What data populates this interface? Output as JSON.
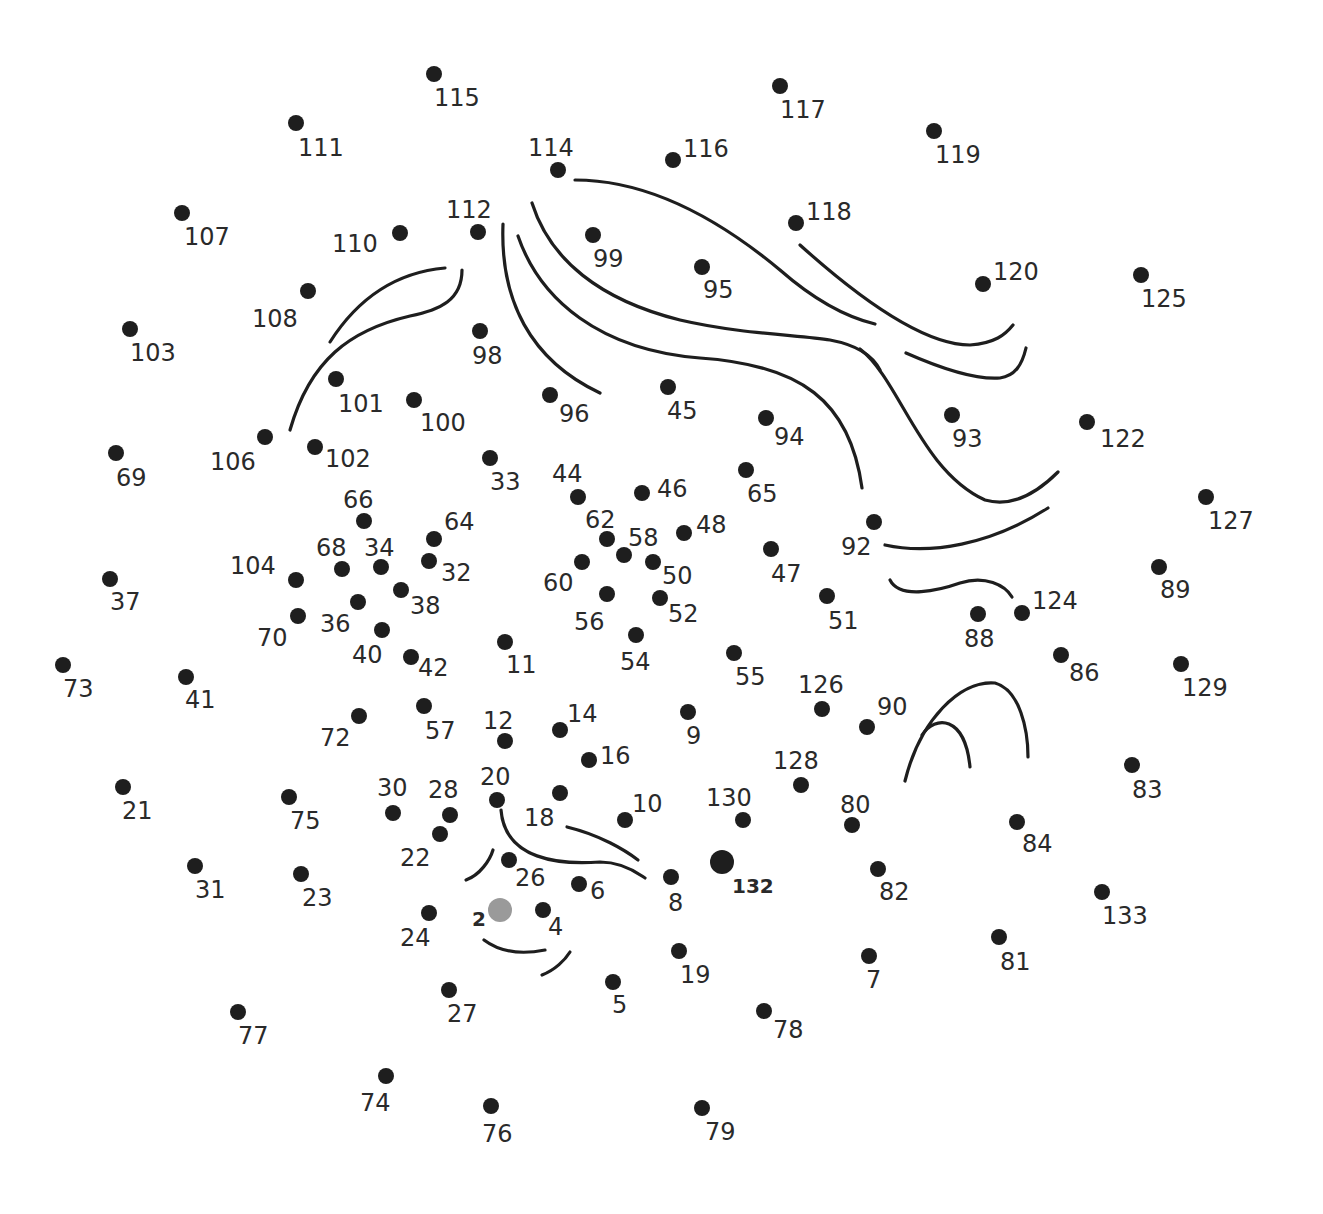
{
  "puzzle": {
    "title": "Dot-to-dot puzzle",
    "dot_color": "#1e1e1e",
    "start_dot_color": "#9a9a9a",
    "start": 2,
    "end": 132,
    "dots": [
      {
        "n": "2",
        "x": 500,
        "y": 910,
        "lx": 472,
        "ly": 926,
        "start": true,
        "bold": true
      },
      {
        "n": "4",
        "x": 543,
        "y": 910,
        "lx": 548,
        "ly": 935
      },
      {
        "n": "5",
        "x": 613,
        "y": 982,
        "lx": 612,
        "ly": 1013
      },
      {
        "n": "6",
        "x": 579,
        "y": 884,
        "lx": 590,
        "ly": 899
      },
      {
        "n": "7",
        "x": 869,
        "y": 956,
        "lx": 866,
        "ly": 988
      },
      {
        "n": "8",
        "x": 671,
        "y": 877,
        "lx": 668,
        "ly": 911
      },
      {
        "n": "9",
        "x": 688,
        "y": 712,
        "lx": 686,
        "ly": 744
      },
      {
        "n": "10",
        "x": 625,
        "y": 820,
        "lx": 632,
        "ly": 812
      },
      {
        "n": "11",
        "x": 505,
        "y": 642,
        "lx": 506,
        "ly": 673
      },
      {
        "n": "12",
        "x": 505,
        "y": 741,
        "lx": 483,
        "ly": 729
      },
      {
        "n": "14",
        "x": 560,
        "y": 730,
        "lx": 567,
        "ly": 722
      },
      {
        "n": "16",
        "x": 589,
        "y": 760,
        "lx": 600,
        "ly": 764
      },
      {
        "n": "18",
        "x": 560,
        "y": 793,
        "lx": 524,
        "ly": 826
      },
      {
        "n": "19",
        "x": 679,
        "y": 951,
        "lx": 680,
        "ly": 983
      },
      {
        "n": "20",
        "x": 497,
        "y": 800,
        "lx": 480,
        "ly": 785
      },
      {
        "n": "21",
        "x": 123,
        "y": 787,
        "lx": 122,
        "ly": 819
      },
      {
        "n": "22",
        "x": 440,
        "y": 834,
        "lx": 400,
        "ly": 866
      },
      {
        "n": "23",
        "x": 301,
        "y": 874,
        "lx": 302,
        "ly": 906
      },
      {
        "n": "24",
        "x": 429,
        "y": 913,
        "lx": 400,
        "ly": 946
      },
      {
        "n": "26",
        "x": 509,
        "y": 860,
        "lx": 515,
        "ly": 886
      },
      {
        "n": "27",
        "x": 449,
        "y": 990,
        "lx": 447,
        "ly": 1022
      },
      {
        "n": "28",
        "x": 450,
        "y": 815,
        "lx": 428,
        "ly": 798
      },
      {
        "n": "30",
        "x": 393,
        "y": 813,
        "lx": 377,
        "ly": 796
      },
      {
        "n": "31",
        "x": 195,
        "y": 866,
        "lx": 195,
        "ly": 898
      },
      {
        "n": "32",
        "x": 429,
        "y": 561,
        "lx": 441,
        "ly": 581
      },
      {
        "n": "33",
        "x": 490,
        "y": 458,
        "lx": 490,
        "ly": 490
      },
      {
        "n": "34",
        "x": 381,
        "y": 567,
        "lx": 364,
        "ly": 556
      },
      {
        "n": "36",
        "x": 358,
        "y": 602,
        "lx": 320,
        "ly": 632
      },
      {
        "n": "37",
        "x": 110,
        "y": 579,
        "lx": 110,
        "ly": 610
      },
      {
        "n": "38",
        "x": 401,
        "y": 590,
        "lx": 410,
        "ly": 614
      },
      {
        "n": "40",
        "x": 382,
        "y": 630,
        "lx": 352,
        "ly": 663
      },
      {
        "n": "41",
        "x": 186,
        "y": 677,
        "lx": 185,
        "ly": 708
      },
      {
        "n": "42",
        "x": 411,
        "y": 657,
        "lx": 418,
        "ly": 676
      },
      {
        "n": "44",
        "x": 578,
        "y": 497,
        "lx": 552,
        "ly": 482
      },
      {
        "n": "45",
        "x": 668,
        "y": 387,
        "lx": 667,
        "ly": 419
      },
      {
        "n": "46",
        "x": 642,
        "y": 493,
        "lx": 657,
        "ly": 497
      },
      {
        "n": "47",
        "x": 771,
        "y": 549,
        "lx": 771,
        "ly": 582
      },
      {
        "n": "48",
        "x": 684,
        "y": 533,
        "lx": 696,
        "ly": 533
      },
      {
        "n": "50",
        "x": 653,
        "y": 562,
        "lx": 662,
        "ly": 584
      },
      {
        "n": "51",
        "x": 827,
        "y": 596,
        "lx": 828,
        "ly": 629
      },
      {
        "n": "52",
        "x": 660,
        "y": 598,
        "lx": 668,
        "ly": 622
      },
      {
        "n": "54",
        "x": 636,
        "y": 635,
        "lx": 620,
        "ly": 670
      },
      {
        "n": "55",
        "x": 734,
        "y": 653,
        "lx": 735,
        "ly": 685
      },
      {
        "n": "56",
        "x": 607,
        "y": 594,
        "lx": 574,
        "ly": 630
      },
      {
        "n": "57",
        "x": 424,
        "y": 706,
        "lx": 425,
        "ly": 739
      },
      {
        "n": "58",
        "x": 624,
        "y": 555,
        "lx": 628,
        "ly": 546
      },
      {
        "n": "60",
        "x": 582,
        "y": 562,
        "lx": 543,
        "ly": 591
      },
      {
        "n": "62",
        "x": 607,
        "y": 539,
        "lx": 585,
        "ly": 528
      },
      {
        "n": "64",
        "x": 434,
        "y": 539,
        "lx": 444,
        "ly": 530
      },
      {
        "n": "65",
        "x": 746,
        "y": 470,
        "lx": 747,
        "ly": 502
      },
      {
        "n": "66",
        "x": 364,
        "y": 521,
        "lx": 343,
        "ly": 508
      },
      {
        "n": "68",
        "x": 342,
        "y": 569,
        "lx": 316,
        "ly": 556
      },
      {
        "n": "69",
        "x": 116,
        "y": 453,
        "lx": 116,
        "ly": 486
      },
      {
        "n": "70",
        "x": 298,
        "y": 616,
        "lx": 257,
        "ly": 646
      },
      {
        "n": "72",
        "x": 359,
        "y": 716,
        "lx": 320,
        "ly": 746
      },
      {
        "n": "73",
        "x": 63,
        "y": 665,
        "lx": 63,
        "ly": 697
      },
      {
        "n": "74",
        "x": 386,
        "y": 1076,
        "lx": 360,
        "ly": 1111
      },
      {
        "n": "75",
        "x": 289,
        "y": 797,
        "lx": 290,
        "ly": 829
      },
      {
        "n": "76",
        "x": 491,
        "y": 1106,
        "lx": 482,
        "ly": 1142
      },
      {
        "n": "77",
        "x": 238,
        "y": 1012,
        "lx": 238,
        "ly": 1044
      },
      {
        "n": "78",
        "x": 764,
        "y": 1011,
        "lx": 773,
        "ly": 1038
      },
      {
        "n": "79",
        "x": 702,
        "y": 1108,
        "lx": 705,
        "ly": 1140
      },
      {
        "n": "80",
        "x": 852,
        "y": 825,
        "lx": 840,
        "ly": 813
      },
      {
        "n": "81",
        "x": 999,
        "y": 937,
        "lx": 1000,
        "ly": 970
      },
      {
        "n": "82",
        "x": 878,
        "y": 869,
        "lx": 879,
        "ly": 900
      },
      {
        "n": "83",
        "x": 1132,
        "y": 765,
        "lx": 1132,
        "ly": 798
      },
      {
        "n": "84",
        "x": 1017,
        "y": 822,
        "lx": 1022,
        "ly": 852
      },
      {
        "n": "86",
        "x": 1061,
        "y": 655,
        "lx": 1069,
        "ly": 681
      },
      {
        "n": "88",
        "x": 978,
        "y": 614,
        "lx": 964,
        "ly": 647
      },
      {
        "n": "89",
        "x": 1159,
        "y": 567,
        "lx": 1160,
        "ly": 598
      },
      {
        "n": "90",
        "x": 867,
        "y": 727,
        "lx": 877,
        "ly": 715
      },
      {
        "n": "92",
        "x": 874,
        "y": 522,
        "lx": 841,
        "ly": 555
      },
      {
        "n": "93",
        "x": 952,
        "y": 415,
        "lx": 952,
        "ly": 447
      },
      {
        "n": "94",
        "x": 766,
        "y": 418,
        "lx": 774,
        "ly": 445
      },
      {
        "n": "95",
        "x": 702,
        "y": 267,
        "lx": 703,
        "ly": 298
      },
      {
        "n": "96",
        "x": 550,
        "y": 395,
        "lx": 559,
        "ly": 422
      },
      {
        "n": "98",
        "x": 480,
        "y": 331,
        "lx": 472,
        "ly": 364
      },
      {
        "n": "99",
        "x": 593,
        "y": 235,
        "lx": 593,
        "ly": 267
      },
      {
        "n": "100",
        "x": 414,
        "y": 400,
        "lx": 420,
        "ly": 431
      },
      {
        "n": "101",
        "x": 336,
        "y": 379,
        "lx": 338,
        "ly": 412
      },
      {
        "n": "102",
        "x": 315,
        "y": 447,
        "lx": 325,
        "ly": 467
      },
      {
        "n": "103",
        "x": 130,
        "y": 329,
        "lx": 130,
        "ly": 361
      },
      {
        "n": "104",
        "x": 296,
        "y": 580,
        "lx": 230,
        "ly": 574
      },
      {
        "n": "106",
        "x": 265,
        "y": 437,
        "lx": 210,
        "ly": 470
      },
      {
        "n": "107",
        "x": 182,
        "y": 213,
        "lx": 184,
        "ly": 245
      },
      {
        "n": "108",
        "x": 308,
        "y": 291,
        "lx": 252,
        "ly": 327
      },
      {
        "n": "110",
        "x": 400,
        "y": 233,
        "lx": 332,
        "ly": 252
      },
      {
        "n": "111",
        "x": 296,
        "y": 123,
        "lx": 298,
        "ly": 156
      },
      {
        "n": "112",
        "x": 478,
        "y": 232,
        "lx": 446,
        "ly": 218
      },
      {
        "n": "114",
        "x": 558,
        "y": 170,
        "lx": 528,
        "ly": 156
      },
      {
        "n": "115",
        "x": 434,
        "y": 74,
        "lx": 434,
        "ly": 106
      },
      {
        "n": "116",
        "x": 673,
        "y": 160,
        "lx": 683,
        "ly": 157
      },
      {
        "n": "117",
        "x": 780,
        "y": 86,
        "lx": 780,
        "ly": 118
      },
      {
        "n": "118",
        "x": 796,
        "y": 223,
        "lx": 806,
        "ly": 220
      },
      {
        "n": "119",
        "x": 934,
        "y": 131,
        "lx": 935,
        "ly": 163
      },
      {
        "n": "120",
        "x": 983,
        "y": 284,
        "lx": 993,
        "ly": 280
      },
      {
        "n": "122",
        "x": 1087,
        "y": 422,
        "lx": 1100,
        "ly": 447
      },
      {
        "n": "124",
        "x": 1022,
        "y": 613,
        "lx": 1032,
        "ly": 609
      },
      {
        "n": "125",
        "x": 1141,
        "y": 275,
        "lx": 1141,
        "ly": 307
      },
      {
        "n": "126",
        "x": 822,
        "y": 709,
        "lx": 798,
        "ly": 693
      },
      {
        "n": "127",
        "x": 1206,
        "y": 497,
        "lx": 1208,
        "ly": 529
      },
      {
        "n": "128",
        "x": 801,
        "y": 785,
        "lx": 773,
        "ly": 769
      },
      {
        "n": "129",
        "x": 1181,
        "y": 664,
        "lx": 1182,
        "ly": 696
      },
      {
        "n": "130",
        "x": 743,
        "y": 820,
        "lx": 706,
        "ly": 806
      },
      {
        "n": "132",
        "x": 722,
        "y": 862,
        "lx": 732,
        "ly": 893,
        "big": true,
        "bold": true
      },
      {
        "n": "133",
        "x": 1102,
        "y": 892,
        "lx": 1102,
        "ly": 924
      }
    ],
    "curves": [
      {
        "id": "hair-left-outer",
        "d": "M330,342 C360,295 400,272 445,268"
      },
      {
        "id": "hair-left-inner",
        "d": "M290,430 C310,360 350,330 410,316 C440,310 462,300 462,270"
      },
      {
        "id": "hair-top-1",
        "d": "M575,180 C650,180 720,220 780,270 C820,305 850,318 875,324"
      },
      {
        "id": "hair-top-2",
        "d": "M532,203 C550,260 600,300 680,320 C740,334 800,335 830,340 C862,346 875,360 880,370"
      },
      {
        "id": "hair-strand-a",
        "d": "M503,224 C500,300 530,360 600,393"
      },
      {
        "id": "hair-strand-b",
        "d": "M518,236 C540,300 600,350 700,358 C800,365 850,400 862,488"
      },
      {
        "id": "hair-strand-c",
        "d": "M800,245 C850,290 920,345 970,345 C995,343 1005,335 1013,325"
      },
      {
        "id": "hair-strand-d",
        "d": "M906,353 C940,368 975,380 1000,378 C1015,376 1022,365 1026,348"
      },
      {
        "id": "hair-long-right",
        "d": "M860,349 C900,380 920,470 985,500 C1020,510 1050,480 1058,472"
      },
      {
        "id": "face-right-1",
        "d": "M885,545 C930,555 990,545 1048,508"
      },
      {
        "id": "face-right-2",
        "d": "M890,580 C900,600 940,590 960,583 C985,575 1005,585 1012,597"
      },
      {
        "id": "ear-outer",
        "d": "M905,781 C920,720 960,680 995,683 C1020,690 1028,730 1028,757"
      },
      {
        "id": "ear-inner",
        "d": "M922,735 C935,715 965,715 970,767"
      },
      {
        "id": "nose",
        "d": "M501,810 C505,860 560,865 600,862 C625,862 640,875 645,878"
      },
      {
        "id": "brow",
        "d": "M567,827 C600,835 625,850 638,860"
      },
      {
        "id": "cheek",
        "d": "M466,880 C480,875 490,860 493,850"
      },
      {
        "id": "mouth",
        "d": "M484,940 C500,952 520,955 545,950"
      },
      {
        "id": "chin",
        "d": "M542,975 C555,970 565,960 570,952"
      }
    ]
  }
}
